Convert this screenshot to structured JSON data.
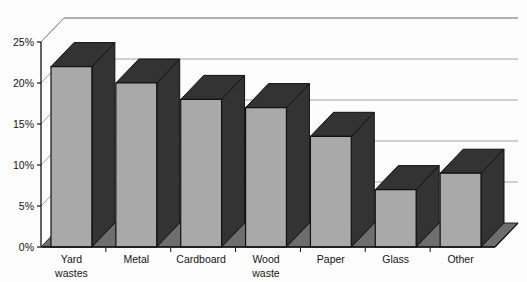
{
  "chart_data": {
    "type": "bar",
    "title": "",
    "subtitle": "",
    "xlabel": "",
    "ylabel": "",
    "style": "3d-column",
    "grid": true,
    "legend": "none",
    "ylim": [
      0,
      25
    ],
    "ytick_step": 5,
    "ytick_labels": [
      "0%",
      "5%",
      "10%",
      "15%",
      "20%",
      "25%"
    ],
    "ytick_values": [
      0,
      5,
      10,
      15,
      20,
      25
    ],
    "categories": [
      "Yard wastes",
      "Metal",
      "Cardboard",
      "Wood waste",
      "Paper",
      "Glass",
      "Other"
    ],
    "category_lines": [
      [
        "Yard",
        "wastes"
      ],
      [
        "Metal"
      ],
      [
        "Cardboard"
      ],
      [
        "Wood",
        "waste"
      ],
      [
        "Paper"
      ],
      [
        "Glass"
      ],
      [
        "Other"
      ]
    ],
    "values": [
      22,
      20,
      18,
      17,
      13.5,
      7,
      9
    ],
    "colors": {
      "bar_front": "#a9a9a9",
      "bar_side": "#333333",
      "bar_top": "#333333",
      "floor": "#6e6e6e",
      "wall": "#fdfdfd",
      "grid": "#8a8a8a",
      "axis": "#111111",
      "text": "#141414",
      "background": "#ffffff"
    }
  }
}
